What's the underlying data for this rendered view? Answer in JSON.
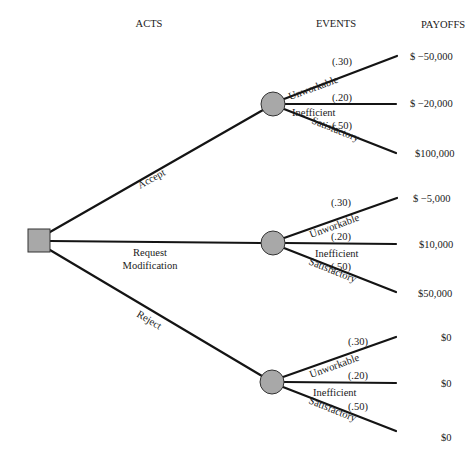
{
  "headers": {
    "acts": "ACTS",
    "events": "EVENTS",
    "payoffs": "PAYOFFS"
  },
  "decision_node": {
    "shape": "square",
    "color": "#a8a8a8"
  },
  "acts": [
    {
      "label": "Accept",
      "events": [
        {
          "label": "Unworkable",
          "probability": "(.30)",
          "payoff": "$ −50,000"
        },
        {
          "label": "Inefficient",
          "probability": "(.20)",
          "payoff": "$ −20,000"
        },
        {
          "label": "Satisfactory",
          "probability": "(.50)",
          "payoff": "$100,000"
        }
      ]
    },
    {
      "label_line1": "Request",
      "label_line2": "Modification",
      "label": "Request Modification",
      "events": [
        {
          "label": "Unworkable",
          "probability": "(.30)",
          "payoff": "$ −5,000"
        },
        {
          "label": "Inefficient",
          "probability": "(.20)",
          "payoff": "$10,000"
        },
        {
          "label": "Satisfactory",
          "probability": "(.50)",
          "payoff": "$50,000"
        }
      ]
    },
    {
      "label": "Reject",
      "events": [
        {
          "label": "Unworkable",
          "probability": "(.30)",
          "payoff": "$0"
        },
        {
          "label": "Inefficient",
          "probability": "(.20)",
          "payoff": "$0"
        },
        {
          "label": "Satisfactory",
          "probability": "(.50)",
          "payoff": "$0"
        }
      ]
    }
  ]
}
